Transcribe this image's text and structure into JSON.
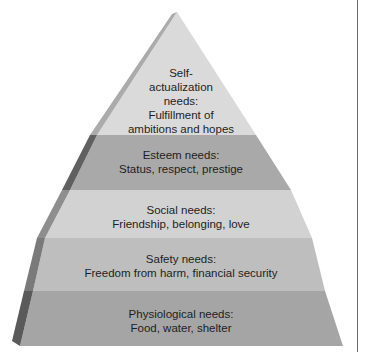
{
  "diagram": {
    "type": "pyramid",
    "levels": [
      {
        "id": "self-actualization",
        "lines": [
          "Self-",
          "actualization",
          "needs:",
          "Fulfillment of",
          "ambitions and hopes"
        ],
        "face": "#dadada",
        "side": "#a8a8a8"
      },
      {
        "id": "esteem",
        "lines": [
          "Esteem needs:",
          "Status, respect, prestige"
        ],
        "face": "#a9a9a9",
        "side": "#5f5f5f"
      },
      {
        "id": "social",
        "lines": [
          "Social needs:",
          "Friendship, belonging, love"
        ],
        "face": "#d2d2d2",
        "side": "#8e8e8e"
      },
      {
        "id": "safety",
        "lines": [
          "Safety needs:",
          "Freedom from harm, financial security"
        ],
        "face": "#bdbdbd",
        "side": "#7a7a7a"
      },
      {
        "id": "physiological",
        "lines": [
          "Physiological needs:",
          "Food, water, shelter"
        ],
        "face": "#a4a4a4",
        "side": "#5a5a5a"
      }
    ]
  }
}
